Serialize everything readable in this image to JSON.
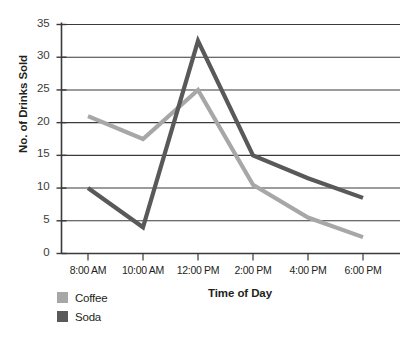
{
  "chart_data": {
    "type": "line",
    "title": "",
    "xlabel": "Time of Day",
    "ylabel": "No. of Drinks Sold",
    "categories": [
      "8:00 AM",
      "10:00 AM",
      "12:00 PM",
      "2:00 PM",
      "4:00 PM",
      "6:00 PM"
    ],
    "series": [
      {
        "name": "Coffee",
        "color": "#a7a7a7",
        "values": [
          21,
          17.5,
          25,
          10.5,
          5.5,
          2.5
        ]
      },
      {
        "name": "Soda",
        "color": "#595959",
        "values": [
          10,
          4,
          32.5,
          15,
          11.5,
          8.5
        ]
      }
    ],
    "ylim": [
      0,
      35
    ],
    "yticks": [
      0,
      5,
      10,
      15,
      20,
      25,
      30,
      35
    ],
    "ytick_labels": [
      "0",
      "5",
      "10",
      "15",
      "20",
      "25",
      "30",
      "35"
    ],
    "grid": "horizontal",
    "legend_position": "bottom-left"
  },
  "legend": {
    "items": [
      {
        "label": "Coffee",
        "color": "#a7a7a7"
      },
      {
        "label": "Soda",
        "color": "#595959"
      }
    ]
  },
  "axes": {
    "y_title": "No. of Drinks Sold",
    "x_title": "Time of Day"
  }
}
